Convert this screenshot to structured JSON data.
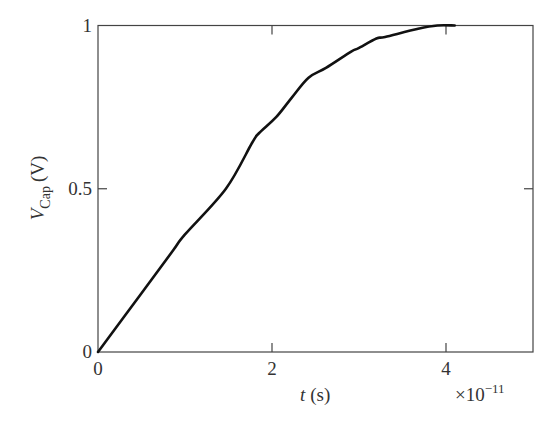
{
  "chart_data": {
    "type": "line",
    "title": "",
    "xlabel": "t (s)",
    "xlabel_italic_part": "t",
    "xlabel_unit": "(s)",
    "ylabel": "V_Cap (V)",
    "ylabel_main": "V",
    "ylabel_sub": "Cap",
    "ylabel_unit": "(V)",
    "x_scale_note": "×10⁻¹¹",
    "xlim": [
      0,
      5
    ],
    "ylim": [
      0,
      1
    ],
    "x_ticks": [
      0,
      2,
      4
    ],
    "x_tick_labels": [
      "0",
      "2",
      "4"
    ],
    "y_ticks": [
      0,
      0.5,
      1
    ],
    "y_tick_labels": [
      "0",
      "0.5",
      "1"
    ],
    "grid": false,
    "legend": null,
    "series": [
      {
        "name": "V_Cap",
        "color": "#111111",
        "x": [
          0,
          0.5,
          0.86,
          1.0,
          1.47,
          1.77,
          1.85,
          2.05,
          2.23,
          2.42,
          2.62,
          2.91,
          2.99,
          3.2,
          3.3,
          3.68,
          3.9,
          4.1
        ],
        "y": [
          0,
          0.18,
          0.31,
          0.36,
          0.5,
          0.64,
          0.67,
          0.72,
          0.78,
          0.84,
          0.87,
          0.92,
          0.93,
          0.96,
          0.965,
          0.99,
          1.0,
          1.0
        ]
      }
    ]
  }
}
